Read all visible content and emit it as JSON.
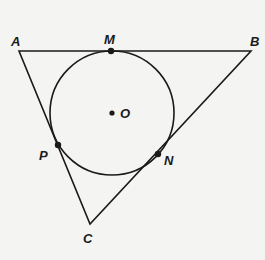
{
  "diagram": {
    "colors": {
      "background": "#f4f4f2",
      "stroke": "#1a1a1a"
    },
    "points": {
      "A": {
        "label": "A",
        "x": 19,
        "y": 51
      },
      "B": {
        "label": "B",
        "x": 251,
        "y": 51
      },
      "C": {
        "label": "C",
        "x": 90,
        "y": 224
      },
      "M": {
        "label": "M",
        "x": 111,
        "y": 51
      },
      "N": {
        "label": "N",
        "x": 158,
        "y": 154
      },
      "P": {
        "label": "P",
        "x": 58,
        "y": 145
      },
      "O": {
        "label": "O",
        "x": 112,
        "y": 113
      }
    },
    "circle": {
      "center": "O",
      "radius": 62
    }
  }
}
